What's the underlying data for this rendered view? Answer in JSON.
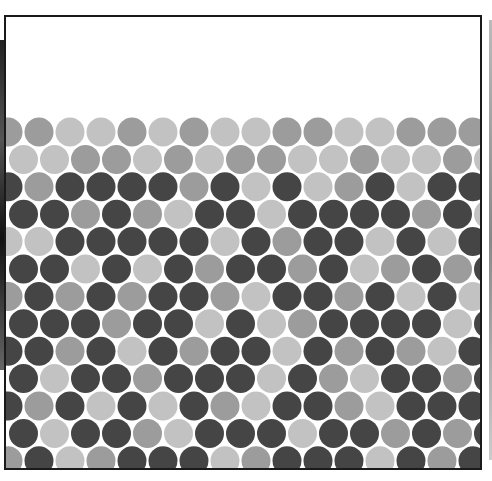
{
  "figure": {
    "palette": {
      "L": "#c2c2c2",
      "M": "#9c9c9c",
      "D": "#454545"
    },
    "geometry": {
      "spacing_x": 31,
      "spacing_y": 27.4,
      "radius": 14.5,
      "first_row_y": 115,
      "even_row_x0": 2,
      "odd_row_x0": 17.5
    },
    "rows": [
      "MMLLMLMLLMMLLMMM",
      "LLMMLMLMMLLMLLML",
      "DMDDDDMDLDLMDLDD",
      "DDMDMLDDLDDDDMDL",
      "LLDDDDDLDMDDLDLD",
      "DDLDLDMDDMDLMDMD",
      "MDMDMDDMLDDMDLDL",
      "DDDMDDLDLMDDDDLD",
      "DDMDLDMDDLDMDMLD",
      "DLDDMDDDLDMLDDMD",
      "DMDLDLDMLDDMLDDD",
      "DLDDMLDDDLDDMDMD",
      "MDLMDDDLMDDDLDMD"
    ]
  }
}
